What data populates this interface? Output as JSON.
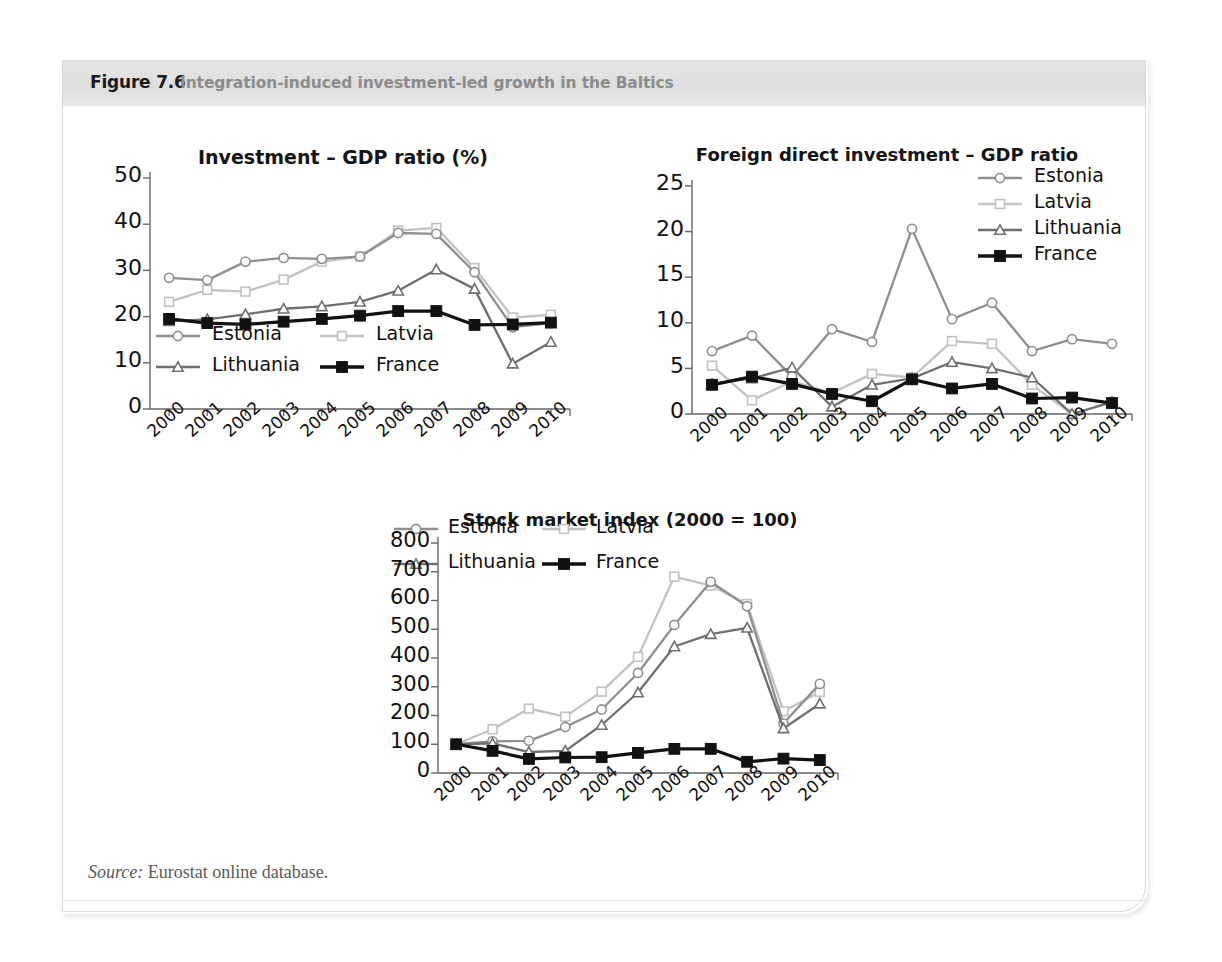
{
  "figure": {
    "label": "Figure 7.6",
    "title": "Integration-induced investment-led growth in the Baltics",
    "source_prefix": "Source:",
    "source_text": "Eurostat online database.",
    "band_color": "#e2e2e2"
  },
  "series_colors": {
    "Estonia": "#8f8f8f",
    "Latvia": "#c2c2c2",
    "Lithuania": "#6f6f6f",
    "France": "#111111"
  },
  "legend_labels": [
    "Estonia",
    "Latvia",
    "Lithuania",
    "France"
  ],
  "chart_data": [
    {
      "id": "investment-gdp",
      "type": "line",
      "title": "Investment  –  GDP ratio (%)",
      "xlabel": "",
      "ylabel": "",
      "x": [
        "2000",
        "2001",
        "2002",
        "2003",
        "2004",
        "2005",
        "2006",
        "2007",
        "2008",
        "2009",
        "2010"
      ],
      "ylim": [
        0,
        50
      ],
      "yticks": [
        0,
        10,
        20,
        30,
        40,
        50
      ],
      "grid": false,
      "legend_position": "inside-bottom-left",
      "series": [
        {
          "name": "Estonia",
          "marker": "circle",
          "values": [
            28.4,
            27.9,
            31.9,
            32.7,
            32.5,
            33.0,
            38.1,
            37.9,
            29.6,
            17.7,
            18.6
          ]
        },
        {
          "name": "Latvia",
          "marker": "square-open",
          "values": [
            23.2,
            25.8,
            25.4,
            28.0,
            31.9,
            33.0,
            38.6,
            39.2,
            30.5,
            19.8,
            20.4
          ]
        },
        {
          "name": "Lithuania",
          "marker": "triangle",
          "values": [
            19.0,
            19.4,
            20.5,
            21.7,
            22.2,
            23.2,
            25.6,
            30.2,
            26.0,
            9.8,
            14.5
          ]
        },
        {
          "name": "France",
          "marker": "square-filled",
          "values": [
            19.5,
            18.6,
            18.3,
            18.9,
            19.5,
            20.2,
            21.2,
            21.2,
            18.2,
            18.3,
            18.7
          ]
        }
      ]
    },
    {
      "id": "fdi-gdp",
      "type": "line",
      "title": "Foreign direct investment  –  GDP ratio",
      "xlabel": "",
      "ylabel": "",
      "x": [
        "2000",
        "2001",
        "2002",
        "2003",
        "2004",
        "2005",
        "2006",
        "2007",
        "2008",
        "2009",
        "2010"
      ],
      "ylim": [
        0,
        25
      ],
      "yticks": [
        0,
        5,
        10,
        15,
        20,
        25
      ],
      "grid": false,
      "legend_position": "top-right",
      "series": [
        {
          "name": "Estonia",
          "marker": "circle",
          "values": [
            6.9,
            8.6,
            4.1,
            9.3,
            7.9,
            20.3,
            10.4,
            12.2,
            6.9,
            8.2,
            7.7
          ]
        },
        {
          "name": "Latvia",
          "marker": "square-open",
          "values": [
            5.3,
            1.5,
            3.6,
            2.3,
            4.4,
            4.0,
            8.0,
            7.7,
            3.2,
            0.0,
            1.3
          ]
        },
        {
          "name": "Lithuania",
          "marker": "triangle",
          "values": [
            3.3,
            3.9,
            5.1,
            0.8,
            3.2,
            3.9,
            5.7,
            5.0,
            4.0,
            0.0,
            1.3
          ]
        },
        {
          "name": "France",
          "marker": "square-filled",
          "values": [
            3.2,
            4.1,
            3.3,
            2.2,
            1.4,
            3.8,
            2.8,
            3.3,
            1.7,
            1.8,
            1.2
          ]
        }
      ]
    },
    {
      "id": "stock-market-index",
      "type": "line",
      "title": "Stock market index (2000 = 100)",
      "xlabel": "",
      "ylabel": "",
      "x": [
        "2000",
        "2001",
        "2002",
        "2003",
        "2004",
        "2005",
        "2006",
        "2007",
        "2008",
        "2009",
        "2010"
      ],
      "ylim": [
        0,
        800
      ],
      "yticks": [
        0,
        100,
        200,
        300,
        400,
        500,
        600,
        700,
        800
      ],
      "grid": false,
      "legend_position": "inside-top-left",
      "series": [
        {
          "name": "Estonia",
          "marker": "circle",
          "values": [
            100,
            110,
            112,
            160,
            221,
            348,
            515,
            665,
            580,
            172,
            310
          ]
        },
        {
          "name": "Latvia",
          "marker": "square-open",
          "values": [
            100,
            152,
            224,
            196,
            283,
            404,
            683,
            652,
            588,
            215,
            282
          ]
        },
        {
          "name": "Lithuania",
          "marker": "triangle",
          "values": [
            100,
            103,
            73,
            77,
            167,
            280,
            440,
            483,
            505,
            155,
            241
          ]
        },
        {
          "name": "France",
          "marker": "square-filled",
          "values": [
            100,
            77,
            49,
            54,
            55,
            70,
            84,
            84,
            39,
            50,
            45
          ]
        }
      ]
    }
  ]
}
